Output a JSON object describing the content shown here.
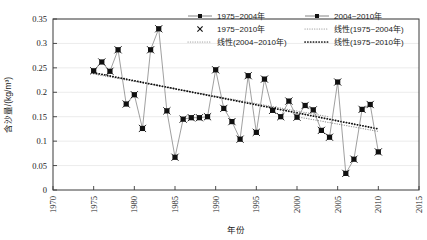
{
  "chart_data": {
    "type": "line",
    "title": "",
    "xlabel": "年份",
    "ylabel": "含沙量/(kg/m³)",
    "xlim": [
      1970,
      2015
    ],
    "ylim": [
      0,
      0.35
    ],
    "xticks": [
      "1970",
      "1975",
      "1980",
      "1985",
      "1990",
      "1995",
      "2000",
      "2005",
      "2010",
      "2015"
    ],
    "yticks": [
      "0",
      "0.05",
      "0.1",
      "0.15",
      "0.2",
      "0.25",
      "0.3",
      "0.35"
    ],
    "grid": true,
    "legend_position": "top-right-inside",
    "series": [
      {
        "name": "1975~2004年",
        "marker": "square",
        "x": [
          1975,
          1976,
          1977,
          1978,
          1979,
          1980,
          1981,
          1982,
          1983,
          1984,
          1985,
          1986,
          1987,
          1988,
          1989,
          1990,
          1991,
          1992,
          1993,
          1994,
          1995,
          1996,
          1997,
          1998,
          1999,
          2000,
          2001,
          2002,
          2003,
          2004
        ],
        "values": [
          0.244,
          0.262,
          0.243,
          0.287,
          0.176,
          0.195,
          0.126,
          0.287,
          0.33,
          0.162,
          0.067,
          0.145,
          0.148,
          0.148,
          0.15,
          0.246,
          0.167,
          0.14,
          0.104,
          0.234,
          0.118,
          0.227,
          0.163,
          0.15,
          0.182,
          0.149,
          0.173,
          0.164,
          0.122,
          0.108
        ]
      },
      {
        "name": "2004~2010年",
        "marker": "square",
        "x": [
          2004,
          2005,
          2006,
          2007,
          2008,
          2009,
          2010
        ],
        "values": [
          0.108,
          0.221,
          0.034,
          0.063,
          0.165,
          0.175,
          0.078
        ]
      },
      {
        "name": "1975~2010年",
        "marker": "x-cross",
        "x": [
          1975,
          1976,
          1977,
          1978,
          1979,
          1980,
          1981,
          1982,
          1983,
          1984,
          1985,
          1986,
          1987,
          1988,
          1989,
          1990,
          1991,
          1992,
          1993,
          1994,
          1995,
          1996,
          1997,
          1998,
          1999,
          2000,
          2001,
          2002,
          2003,
          2004,
          2005,
          2006,
          2007,
          2008,
          2009,
          2010
        ],
        "values": [
          0.244,
          0.262,
          0.243,
          0.287,
          0.176,
          0.195,
          0.126,
          0.287,
          0.33,
          0.162,
          0.067,
          0.145,
          0.148,
          0.148,
          0.15,
          0.246,
          0.167,
          0.14,
          0.104,
          0.234,
          0.118,
          0.227,
          0.163,
          0.15,
          0.182,
          0.149,
          0.173,
          0.164,
          0.122,
          0.108,
          0.221,
          0.034,
          0.063,
          0.165,
          0.175,
          0.078
        ]
      }
    ],
    "trendlines": [
      {
        "name": "线性(1975~2004年)",
        "style": "dotted-light",
        "x": [
          1975,
          2004
        ],
        "values": [
          0.2375,
          0.1495
        ]
      },
      {
        "name": "线性(2004~2010年)",
        "style": "dotted-light",
        "x": [
          2000,
          2010
        ],
        "values": [
          0.15,
          0.12
        ]
      },
      {
        "name": "线性(1975~2010年)",
        "style": "dotted-bold",
        "x": [
          1975,
          2010
        ],
        "values": [
          0.24,
          0.125
        ]
      }
    ]
  },
  "legend": {
    "items": [
      {
        "label": "1975~2004年",
        "marker": "line-square"
      },
      {
        "label": "2004~2010年",
        "marker": "line-square"
      },
      {
        "label": "1975~2010年",
        "marker": "x-cross"
      },
      {
        "label": "线性(1975~2004年)",
        "marker": "dotted-light"
      },
      {
        "label": "线性(2004~2010年)",
        "marker": "dotted-light"
      },
      {
        "label": "线性(1975~2010年)",
        "marker": "dotted-bold"
      }
    ]
  },
  "colors": {
    "series_line": "#777777",
    "marker": "#111111",
    "trend_bold": "#111111",
    "trend_light": "#9a9a9a",
    "grid": "#e2e2e2",
    "axis": "#3a3a3a",
    "text": "#1a1a1a",
    "background": "#ffffff"
  }
}
